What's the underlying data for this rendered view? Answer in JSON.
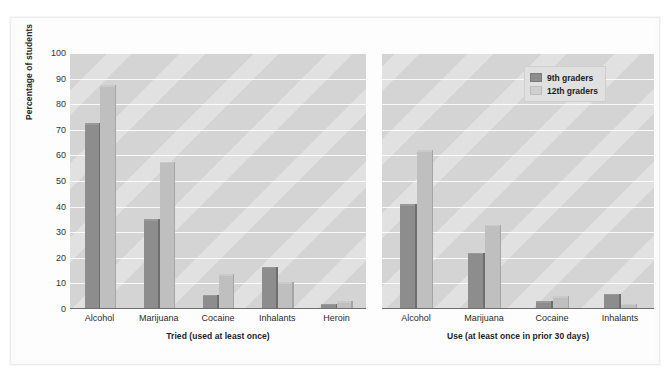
{
  "chart_data": {
    "type": "bar",
    "title": "",
    "ylabel": "Percentage of students",
    "xlabel": "",
    "ylim": [
      0,
      100
    ],
    "yticks": [
      0,
      10,
      20,
      30,
      40,
      50,
      60,
      70,
      80,
      90,
      100
    ],
    "grid": true,
    "legend_position": "top-right",
    "legend": [
      "9th graders",
      "12th graders"
    ],
    "colors": {
      "series_9th": "#8d8d8d",
      "series_12th": "#bfbfbf",
      "plot_background": "#d4d4d4",
      "gridline": "#fafafa",
      "axis": "#707070",
      "text": "#1d1d1d",
      "card_background": "#fbfbfb"
    },
    "panels": [
      {
        "title": "Tried (used at least once)",
        "categories": [
          "Alcohol",
          "Marijuana",
          "Cocaine",
          "Inhalants",
          "Heroin"
        ],
        "series": [
          {
            "name": "9th graders",
            "values": [
              72.5,
              35,
              5.5,
              16.5,
              2
            ]
          },
          {
            "name": "12th graders",
            "values": [
              87.5,
              57.5,
              13.5,
              10.5,
              3
            ]
          }
        ]
      },
      {
        "title": "Use (at least once in prior 30 days)",
        "categories": [
          "Alcohol",
          "Marijuana",
          "Cocaine",
          "Inhalants"
        ],
        "series": [
          {
            "name": "9th graders",
            "values": [
              41,
              22,
              3,
              6
            ]
          },
          {
            "name": "12th graders",
            "values": [
              62,
              33,
              5,
              2
            ]
          }
        ]
      }
    ]
  }
}
